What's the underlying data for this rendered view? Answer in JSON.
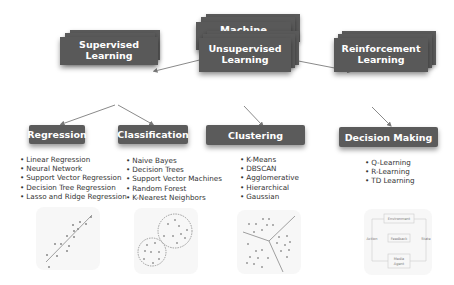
{
  "root": {
    "label": "Machine Learning"
  },
  "categories": [
    {
      "label": "Supervised Learning"
    },
    {
      "label_line1": "Unsupervised",
      "label_line2": "Learning"
    },
    {
      "label_line1": "Reinforcement",
      "label_line2": "Learning"
    }
  ],
  "tasks": [
    {
      "label": "Regression",
      "items": [
        "Linear Regression",
        "Neural Network",
        "Support Vector Regression",
        "Decision Tree Regression",
        "Lasso and Ridge Regression"
      ]
    },
    {
      "label": "Classification",
      "items": [
        "Naive Bayes",
        "Decision Trees",
        "Support Vector Machines",
        "Random Forest",
        "K-Nearest Neighbors"
      ]
    },
    {
      "label": "Clustering",
      "items": [
        "K-Means",
        "DBSCAN",
        "Agglomerative",
        "Hierarchical",
        "Gaussian"
      ]
    },
    {
      "label": "Decision Making",
      "items": [
        "Q-Learning",
        "R-Learning",
        "TD Learning"
      ]
    }
  ],
  "rl_diagram": {
    "environment": "Environment",
    "feedback": "Feedback",
    "action": "Action",
    "state": "State",
    "agent_line1": "Media",
    "agent_line2": "Agent"
  },
  "colors": {
    "box": "#5a5a5a",
    "text": "#ffffff",
    "list_text": "#333333",
    "connector": "#7a7a7a"
  }
}
